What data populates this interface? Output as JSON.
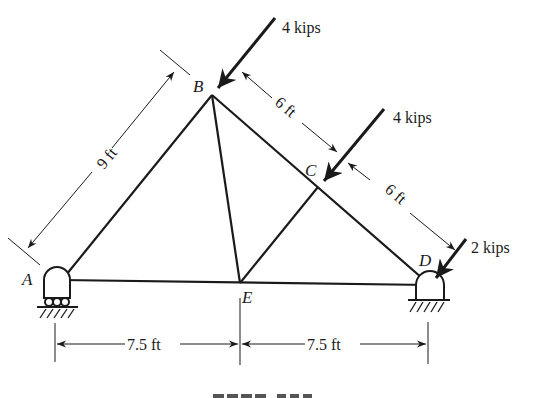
{
  "figure": {
    "type": "truss diagram",
    "caption_partial": "PROB. 3.3x (cut off)"
  },
  "nodes": [
    {
      "id": "A",
      "label": "A",
      "x": 62,
      "y": 280
    },
    {
      "id": "B",
      "label": "B",
      "x": 212,
      "y": 95
    },
    {
      "id": "C",
      "label": "C",
      "x": 318,
      "y": 187
    },
    {
      "id": "D",
      "label": "D",
      "x": 430,
      "y": 285
    },
    {
      "id": "E",
      "label": "E",
      "x": 240,
      "y": 283
    }
  ],
  "members": [
    [
      "A",
      "B"
    ],
    [
      "B",
      "C"
    ],
    [
      "C",
      "D"
    ],
    [
      "A",
      "E"
    ],
    [
      "E",
      "D"
    ],
    [
      "B",
      "E"
    ],
    [
      "C",
      "E"
    ]
  ],
  "supports": [
    {
      "node": "A",
      "type": "roller"
    },
    {
      "node": "D",
      "type": "pin"
    }
  ],
  "loads": [
    {
      "node": "B",
      "label": "4 kips"
    },
    {
      "node": "C",
      "label": "4 kips"
    },
    {
      "node": "D",
      "label": "2 kips"
    }
  ],
  "dimensions": [
    {
      "label": "9 ft",
      "between": "A-B"
    },
    {
      "label": "6 ft",
      "between": "B-C"
    },
    {
      "label": "6 ft",
      "between": "C-D"
    },
    {
      "label": "7.5 ft",
      "between": "A-E"
    },
    {
      "label": "7.5 ft",
      "between": "E-D"
    }
  ],
  "colors": {
    "ink": "#1a1a1a",
    "background": "#ffffff"
  }
}
